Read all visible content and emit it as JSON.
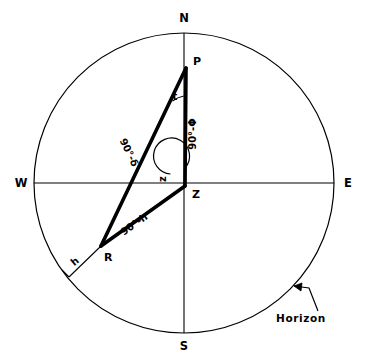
{
  "figure": {
    "type": "celestial-sphere-horizon-diagram",
    "background_color": "#ffffff",
    "stroke_color": "#000000"
  },
  "horizon_circle": {
    "name": "horizon",
    "center_x": 184,
    "center_y": 183,
    "radius": 150,
    "stroke_width": 1.2
  },
  "cardinal_points": {
    "north": {
      "label": "N",
      "x": 184,
      "y": 33,
      "text_x": 184,
      "text_y": 22
    },
    "south": {
      "label": "S",
      "x": 184,
      "y": 333,
      "text_x": 184,
      "text_y": 348
    },
    "east": {
      "label": "E",
      "x": 334,
      "y": 183,
      "text_x": 348,
      "text_y": 187
    },
    "west": {
      "label": "W",
      "x": 34,
      "y": 183,
      "text_x": 21,
      "text_y": 187
    }
  },
  "vertices": {
    "pole": {
      "label": "P",
      "x": 186,
      "y": 68,
      "text_x": 193,
      "text_y": 64,
      "description": "celestial pole"
    },
    "zenith": {
      "label": "Z",
      "x": 185,
      "y": 186,
      "text_x": 193,
      "text_y": 197,
      "description": "zenith"
    },
    "star": {
      "label": "R",
      "x": 101,
      "y": 246,
      "text_x": 105,
      "text_y": 259,
      "description": "star position"
    }
  },
  "triangle_sides": [
    {
      "name": "pole-to-zenith",
      "label": "90°-Φ",
      "from": "P",
      "to": "Z",
      "label_x": 195,
      "label_y": 133,
      "label_rotation": -90
    },
    {
      "name": "pole-to-star",
      "label": "90°-δ",
      "from": "P",
      "to": "R",
      "label_x": 125,
      "label_y": 152,
      "label_rotation": 55
    },
    {
      "name": "zenith-to-star",
      "label": "90°-h",
      "from": "Z",
      "to": "R",
      "label_x": 133,
      "label_y": 226,
      "label_rotation": -36
    }
  ],
  "angles": [
    {
      "name": "hour-angle",
      "label": "t",
      "at_vertex": "P",
      "label_x": 177,
      "label_y": 97
    },
    {
      "name": "azimuth-angle",
      "label": "z",
      "at_vertex": "Z",
      "label_x": 166,
      "label_y": 178
    }
  ],
  "altitude_marker": {
    "name": "altitude-arc",
    "label": "h",
    "from_x": 101,
    "from_y": 246,
    "to_x": 69,
    "to_y": 277,
    "label_x": 75,
    "label_y": 262
  },
  "annotation": {
    "label": "Horizon",
    "text_x": 276,
    "text_y": 318,
    "leader_points": "318,311 309,288 294,286",
    "arrow_tip_x": 294,
    "arrow_tip_y": 286
  }
}
